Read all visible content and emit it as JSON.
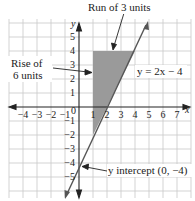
{
  "title_annotation": "Run of 3 units",
  "rise_annotation_line1": "Rise of",
  "rise_annotation_line2": "6 units",
  "equation_label": "y = 2x − 4",
  "intercept_label": "y intercept (0, −4)",
  "axes": {
    "x_label": "x",
    "y_label": "y",
    "origin_label": "0",
    "x_ticks": [
      "−4",
      "−3",
      "−2",
      "−1",
      "1",
      "2",
      "3",
      "4",
      "5",
      "6",
      "7"
    ],
    "y_ticks": [
      "5",
      "4",
      "3",
      "2",
      "1",
      "−1",
      "−2",
      "−3",
      "−4",
      "−5"
    ]
  },
  "colors": {
    "grid": "#c8c8c8",
    "axis": "#222222",
    "shade": "#9a9a9a",
    "line": "#555555"
  }
}
